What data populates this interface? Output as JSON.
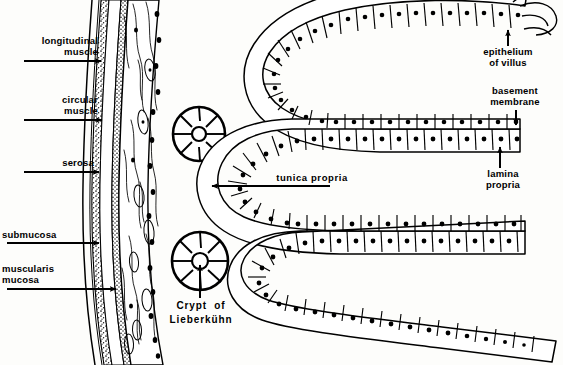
{
  "figure": {
    "background_color": "#fdfdfb",
    "ink_color": "#000000",
    "width": 563,
    "height": 365
  },
  "labels_left": [
    {
      "id": "longitudinal-muscle",
      "text": "longitudinal\nmuscle",
      "x": 14,
      "y": 39,
      "arrow": {
        "x1": 24,
        "y1": 61,
        "x2": 105,
        "y2": 61
      }
    },
    {
      "id": "circular-muscle",
      "text": "circular\nmuscle",
      "x": 40,
      "y": 98,
      "arrow": {
        "x1": 24,
        "y1": 120,
        "x2": 106,
        "y2": 120
      }
    },
    {
      "id": "serosa",
      "text": "serosa",
      "x": 22,
      "y": 161,
      "arrow": {
        "x1": 24,
        "y1": 172,
        "x2": 103,
        "y2": 172
      }
    },
    {
      "id": "submucosa",
      "text": "submucosa",
      "x": 8,
      "y": 232,
      "arrow": {
        "x1": 7,
        "y1": 243,
        "x2": 103,
        "y2": 243
      }
    },
    {
      "id": "muscularis-mucosa",
      "text": "muscularis\nmucosa",
      "x": 10,
      "y": 267,
      "arrow": {
        "x1": 7,
        "y1": 289,
        "x2": 120,
        "y2": 289
      }
    }
  ],
  "labels_right": [
    {
      "id": "epithelium-of-villus",
      "text": "epithelium\nof villus",
      "x": 478,
      "y": 48,
      "arrow": {
        "x1": 508,
        "y1": 46,
        "x2": 508,
        "y2": 27
      }
    },
    {
      "id": "basement-membrane",
      "text": "basement\nmembrane",
      "x": 477,
      "y": 88,
      "arrow": {
        "x1": 516,
        "y1": 110,
        "x2": 516,
        "y2": 128
      }
    },
    {
      "id": "lamina-propria",
      "text": "lamina\npropria",
      "x": 473,
      "y": 170,
      "arrow": {
        "x1": 500,
        "y1": 168,
        "x2": 500,
        "y2": 144
      }
    }
  ],
  "labels_mid": [
    {
      "id": "tunica-propria",
      "text": "tunica propria",
      "x": 275,
      "y": 176,
      "arrow": {
        "x1": 330,
        "y1": 186,
        "x2": 208,
        "y2": 186
      }
    }
  ],
  "labels_crypt": [
    {
      "id": "crypt-of-lieberkuhn",
      "text": "Crypt  of\nLieberkühn",
      "x": 140,
      "y": 300,
      "arrow": {
        "x1": 200,
        "y1": 298,
        "x2": 200,
        "y2": 262
      }
    }
  ],
  "structures": {
    "tissue_strip": {
      "name": "intestinal-wall-cross-section",
      "description": "vertical stippled and fibrous wall strip on the left",
      "x": 85,
      "width": 75
    },
    "crypts": [
      {
        "name": "crypt-cross-section-upper",
        "cx": 199,
        "cy": 134,
        "rx": 26,
        "ry": 27,
        "spokes": 8,
        "lumen_r": 7
      },
      {
        "name": "crypt-cross-section-lower",
        "cx": 200,
        "cy": 261,
        "rx": 28,
        "ry": 29,
        "spokes": 8,
        "lumen_r": 8
      }
    ],
    "villus_band": {
      "name": "serpentine-villus-epithelium",
      "description": "folded band of columnar epithelial cells, each cell containing a nucleus dot",
      "folds": 3,
      "cell_count": 146
    }
  }
}
